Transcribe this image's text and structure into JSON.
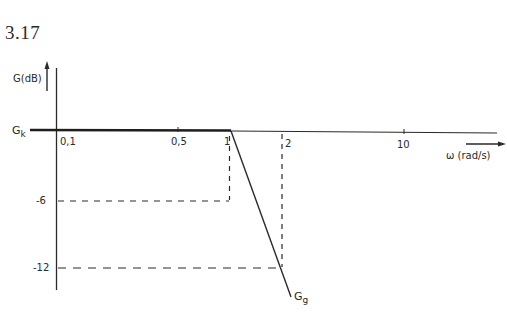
{
  "figure": {
    "number": "3.17"
  },
  "axes": {
    "y_label": "G(dB)",
    "x_label": "ω (rad/s)",
    "y_ticks": [
      "-6",
      "-12"
    ],
    "x_ticks": [
      "0,1",
      "0,5",
      "1",
      "2",
      "10"
    ]
  },
  "curves": {
    "gk_label": "G",
    "gk_sub": "k",
    "gg_label": "G",
    "gg_sub": "g"
  },
  "colors": {
    "ink": "#2a2a2a"
  }
}
